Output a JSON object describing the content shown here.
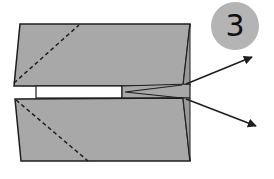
{
  "diagram": {
    "step_number": "3",
    "colors": {
      "paper": "#a8a8a8",
      "outline": "#1e1e1e",
      "badge": "#b4b4b4",
      "background": "#ffffff"
    },
    "elements": [
      {
        "type": "top-flap",
        "fold": "dashed diagonal valley line"
      },
      {
        "type": "bottom-flap",
        "fold": "dashed diagonal valley line"
      },
      {
        "type": "center-slit",
        "fill": "white"
      },
      {
        "type": "nose-wedge"
      },
      {
        "type": "arrow",
        "direction": "up-right"
      },
      {
        "type": "arrow",
        "direction": "down-right"
      }
    ]
  }
}
